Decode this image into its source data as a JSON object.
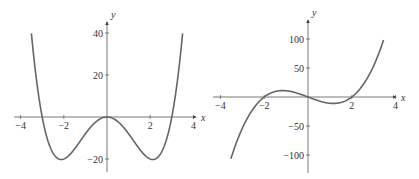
{
  "chart_data": [
    {
      "type": "line",
      "title": "",
      "xlabel": "x",
      "ylabel": "y",
      "function": "y = x^4 - 9x^2",
      "xlim": [
        -4,
        4
      ],
      "ylim": [
        -25,
        45
      ],
      "grid": false,
      "x_ticks": [
        -4,
        -2,
        2,
        4
      ],
      "x_tick_labels": [
        "−4",
        "−2",
        "2",
        "4"
      ],
      "y_ticks": [
        40,
        20,
        -20
      ],
      "y_tick_labels": [
        "40",
        "20",
        "−20"
      ],
      "domain": [
        -3.5,
        3.5
      ],
      "key_points": [
        {
          "x": -3.5,
          "y": 40
        },
        {
          "x": -3,
          "y": 0
        },
        {
          "x": -2.12,
          "y": -20
        },
        {
          "x": 0,
          "y": 0
        },
        {
          "x": 2.12,
          "y": -20
        },
        {
          "x": 3,
          "y": 0
        },
        {
          "x": 3.5,
          "y": 40
        }
      ],
      "line_color": "#666666"
    },
    {
      "type": "line",
      "title": "",
      "xlabel": "x",
      "ylabel": "y",
      "function": "y = 3.6(x^3 - 4x)",
      "xlim": [
        -4,
        4
      ],
      "ylim": [
        -130,
        130
      ],
      "grid": false,
      "x_ticks": [
        -4,
        -2,
        2,
        4
      ],
      "x_tick_labels": [
        "−4",
        "−2",
        "2",
        "4"
      ],
      "y_ticks": [
        100,
        50,
        -50,
        -100
      ],
      "y_tick_labels": [
        "100",
        "50",
        "−50",
        "−100"
      ],
      "domain": [
        -3.52,
        3.45
      ],
      "key_points": [
        {
          "x": -3.5,
          "y": -105
        },
        {
          "x": -2,
          "y": 0
        },
        {
          "x": -1.15,
          "y": 11
        },
        {
          "x": 0,
          "y": 0
        },
        {
          "x": 1.15,
          "y": -11
        },
        {
          "x": 2,
          "y": 0
        },
        {
          "x": 3.45,
          "y": 98
        }
      ],
      "line_color": "#666666"
    }
  ]
}
